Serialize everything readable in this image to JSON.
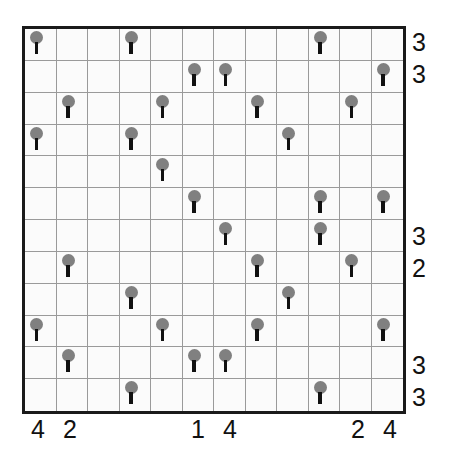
{
  "puzzle": {
    "name": "tents-and-trees-grid",
    "type": "grid-logic-puzzle",
    "rows": 12,
    "cols": 12,
    "cell_size_px": 32,
    "colors": {
      "border": "#1a1a1a",
      "gridline": "#9a9a9a",
      "background": "#fbfbfb",
      "tree_canopy": "#808080",
      "tree_trunk": "#111111",
      "clue_text": "#111111"
    },
    "row_clues": [
      "3",
      "3",
      "",
      "",
      "",
      "",
      "3",
      "2",
      "",
      "",
      "3",
      "3"
    ],
    "col_clues": [
      "4",
      "2",
      "",
      "",
      "",
      "1",
      "4",
      "",
      "",
      "",
      "2",
      "4"
    ],
    "tree_icon_name": "tree-icon",
    "grid": [
      [
        1,
        0,
        0,
        1,
        0,
        0,
        0,
        0,
        0,
        1,
        0,
        0
      ],
      [
        0,
        0,
        0,
        0,
        0,
        1,
        1,
        0,
        0,
        0,
        0,
        1
      ],
      [
        0,
        1,
        0,
        0,
        1,
        0,
        0,
        1,
        0,
        0,
        1,
        0
      ],
      [
        1,
        0,
        0,
        1,
        0,
        0,
        0,
        0,
        1,
        0,
        0,
        0
      ],
      [
        0,
        0,
        0,
        0,
        1,
        0,
        0,
        0,
        0,
        0,
        0,
        0
      ],
      [
        0,
        0,
        0,
        0,
        0,
        1,
        0,
        0,
        0,
        1,
        0,
        1
      ],
      [
        0,
        0,
        0,
        0,
        0,
        0,
        1,
        0,
        0,
        1,
        0,
        0
      ],
      [
        0,
        1,
        0,
        0,
        0,
        0,
        0,
        1,
        0,
        0,
        1,
        0
      ],
      [
        0,
        0,
        0,
        1,
        0,
        0,
        0,
        0,
        1,
        0,
        0,
        0
      ],
      [
        1,
        0,
        0,
        0,
        1,
        0,
        0,
        1,
        0,
        0,
        0,
        1
      ],
      [
        0,
        1,
        0,
        0,
        0,
        1,
        1,
        0,
        0,
        0,
        0,
        0
      ],
      [
        0,
        0,
        0,
        1,
        0,
        0,
        0,
        0,
        0,
        1,
        0,
        0
      ]
    ]
  }
}
